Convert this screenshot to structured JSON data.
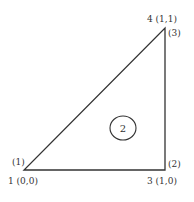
{
  "diagram": {
    "type": "finite-element-triangle",
    "element": {
      "number": "2"
    },
    "nodes": [
      {
        "id": "node-1",
        "global_label": "1 (0,0)",
        "local_label": "(1)"
      },
      {
        "id": "node-3",
        "global_label": "3 (1,0)",
        "local_label": "(2)"
      },
      {
        "id": "node-4",
        "global_label": "4 (1,1)",
        "local_label": "(3)"
      }
    ],
    "colors": {
      "stroke": "#333333",
      "background": "#ffffff"
    }
  }
}
